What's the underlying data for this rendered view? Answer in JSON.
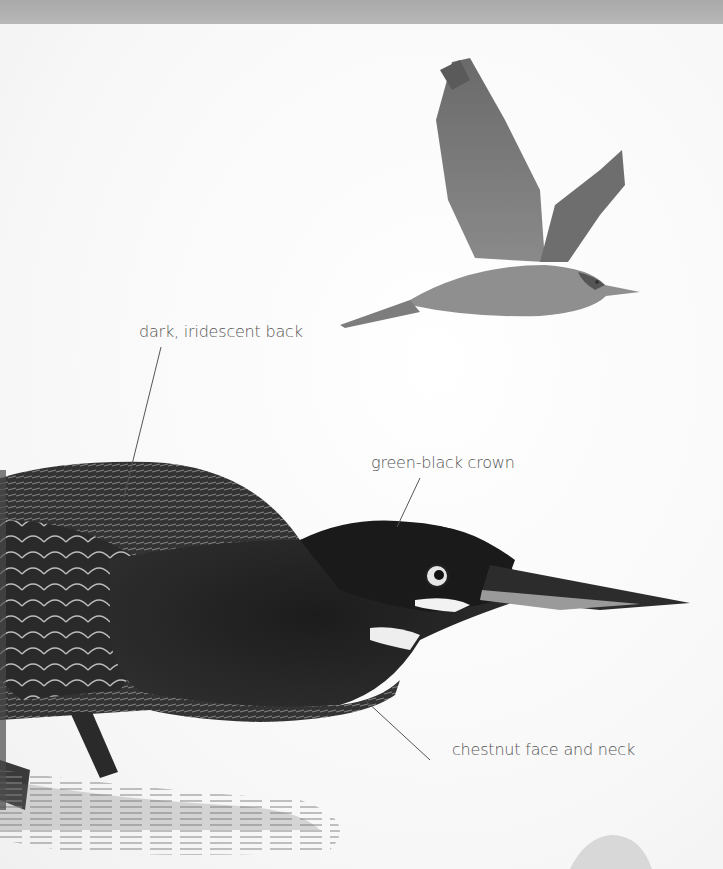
{
  "illustration": {
    "subject": "heron illustration",
    "figures": [
      "flying heron",
      "standing heron head and body"
    ]
  },
  "annotations": [
    {
      "id": "back",
      "text": "dark, iridescent back"
    },
    {
      "id": "crown",
      "text": "green-black crown"
    },
    {
      "id": "neck",
      "text": "chestnut face and neck"
    }
  ],
  "colors": {
    "background": "#fdfdfd",
    "top_band": "#b0b0b0",
    "label_text": "#555555",
    "leader_line": "#555555"
  }
}
